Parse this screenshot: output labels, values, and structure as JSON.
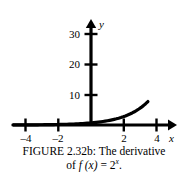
{
  "figure": {
    "caption_line1": "FIGURE 2.32b: The derivative",
    "caption_line2_prefix": "of ",
    "caption_line2_fn": "f",
    "caption_line2_arg": " (x)",
    "caption_line2_eq": " = 2",
    "caption_line2_exp": "x",
    "caption_line2_end": "."
  },
  "chart_data": {
    "type": "line",
    "xlabel": "x",
    "ylabel": "y",
    "xlim": [
      -5,
      5.6
    ],
    "ylim": [
      -2,
      31
    ],
    "xticks": [
      -4,
      -2,
      2,
      4
    ],
    "xtick_labels": [
      "–4",
      "–2",
      "2",
      "4"
    ],
    "yticks": [
      10,
      20,
      30
    ],
    "ytick_labels": [
      "10",
      "20",
      "30"
    ],
    "grid": false,
    "legend": null,
    "series": [
      {
        "name": "derivative of 2^x",
        "formula": "y = ln(2) * 2^x",
        "x": [
          -5,
          -4,
          -3,
          -2,
          -1,
          0,
          1,
          2,
          3,
          4,
          4.5,
          5
        ],
        "values": [
          0.02,
          0.04,
          0.09,
          0.17,
          0.35,
          0.69,
          1.39,
          2.77,
          5.55,
          11.09,
          15.68,
          22.18
        ]
      }
    ]
  },
  "axes": {
    "y_axis_label": "y",
    "x_axis_label": "x"
  }
}
